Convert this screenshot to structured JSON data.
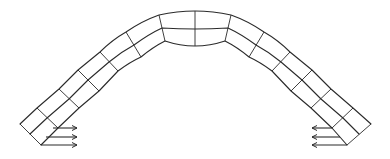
{
  "diagram": {
    "type": "finite-element mesh of an arch with horizontal support loads",
    "elements": {
      "layers": 2,
      "segments_per_half": 7,
      "total_segments": 14
    },
    "supports": {
      "left": {
        "arrow_count": 3,
        "direction": "right"
      },
      "right": {
        "arrow_count": 3,
        "direction": "left"
      }
    },
    "colors": {
      "stroke": "#2a2a2a",
      "background": "#ffffff"
    }
  }
}
